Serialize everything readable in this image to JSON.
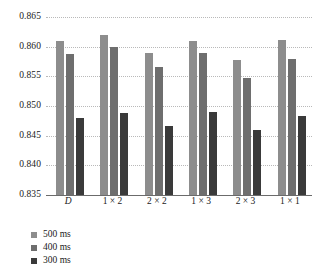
{
  "chart_data": {
    "type": "bar",
    "title": "",
    "subtitle": "",
    "xlabel": "",
    "ylabel": "",
    "ylim": [
      0.835,
      0.865
    ],
    "ytick_labels": [
      "0.865",
      "0.860",
      "0.855",
      "0.850",
      "0.845",
      "0.840",
      "0.835"
    ],
    "ytick_values": [
      0.865,
      0.86,
      0.855,
      0.85,
      0.845,
      0.84,
      0.835
    ],
    "grid": true,
    "legend_position": "bottom-left",
    "categories": [
      "D",
      "1 × 2",
      "2 × 2",
      "1 × 3",
      "2 × 3",
      "1 × 1"
    ],
    "series": [
      {
        "name": "500 ms",
        "color": "#8d8d8d",
        "values": [
          0.861,
          0.862,
          0.859,
          0.8609,
          0.8577,
          0.8612
        ]
      },
      {
        "name": "400 ms",
        "color": "#6e6e6e",
        "values": [
          0.8587,
          0.86,
          0.8565,
          0.859,
          0.8548,
          0.858
        ]
      },
      {
        "name": "300 ms",
        "color": "#3a3a3a",
        "values": [
          0.848,
          0.8488,
          0.8466,
          0.849,
          0.846,
          0.8484
        ]
      }
    ]
  },
  "legend": {
    "items": [
      {
        "label": "500 ms",
        "color": "#8d8d8d"
      },
      {
        "label": "400 ms",
        "color": "#6e6e6e"
      },
      {
        "label": "300 ms",
        "color": "#3a3a3a"
      }
    ]
  },
  "colors": {
    "series_500ms": "#8d8d8d",
    "series_400ms": "#6e6e6e",
    "series_300ms": "#3a3a3a",
    "gridline": "#b9b9b9",
    "axis": "#6b6b6b",
    "background": "#ffffff",
    "text": "#1a1a1a"
  }
}
